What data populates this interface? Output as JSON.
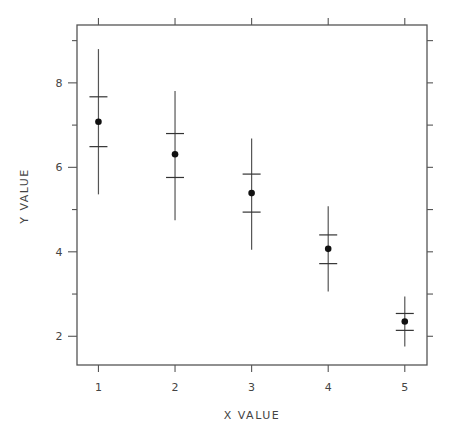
{
  "chart_data": {
    "type": "scatter",
    "title": "",
    "xlabel": "X VALUE",
    "ylabel": "Y VALUE",
    "xlim": [
      0.72,
      5.29
    ],
    "ylim": [
      1.32,
      9.37
    ],
    "x_ticks": [
      1,
      2,
      3,
      4,
      5
    ],
    "x_tick_labels": [
      "1",
      "2",
      "3",
      "4",
      "5"
    ],
    "y_ticks_major": [
      2,
      4,
      6,
      8
    ],
    "y_tick_labels": [
      "2",
      "4",
      "6",
      "8"
    ],
    "y_ticks_minor": [
      3,
      5,
      7,
      9
    ],
    "grid": false,
    "legend": null,
    "series": [
      {
        "name": "mean with error bars",
        "x": [
          1,
          2,
          3,
          4,
          5
        ],
        "y": [
          7.08,
          6.31,
          5.39,
          4.07,
          2.35
        ],
        "inner_upper": [
          7.67,
          6.8,
          5.84,
          4.4,
          2.54
        ],
        "inner_lower": [
          6.49,
          5.76,
          4.94,
          3.72,
          2.14
        ],
        "outer_upper": [
          8.8,
          7.81,
          6.68,
          5.08,
          2.94
        ],
        "outer_lower": [
          5.36,
          4.75,
          4.05,
          3.06,
          1.76
        ]
      }
    ]
  },
  "axes": {
    "x_label": "X VALUE",
    "y_label": "Y VALUE"
  }
}
